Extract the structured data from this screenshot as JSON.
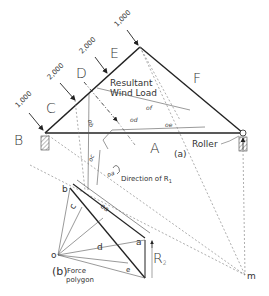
{
  "diagram": {
    "part_a_label": "(a)",
    "part_b_label": "(b)",
    "truss": {
      "regions": [
        "A",
        "B",
        "C",
        "D",
        "E",
        "F"
      ],
      "loads": [
        {
          "value": "1,000",
          "region_before": "B",
          "region_after": "C"
        },
        {
          "value": "2,000",
          "region_before": "C",
          "region_after": "D"
        },
        {
          "value": "2,000",
          "region_before": "D",
          "region_after": "E"
        },
        {
          "value": "1,000",
          "region_before": "E",
          "region_after": "F"
        }
      ],
      "resultant_label_line1": "Resultant",
      "resultant_label_line2": "Wind Load",
      "right_support_label": "Roller",
      "direction_label": "Direction of R",
      "direction_subscript": "1",
      "funicular_rays": [
        "oa",
        "ob",
        "oc",
        "od",
        "oe",
        "of"
      ],
      "pole_point": "m"
    },
    "force_polygon": {
      "title_line1": "Force",
      "title_line2": "polygon",
      "points": [
        "a",
        "b",
        "c",
        "d",
        "e",
        "o"
      ],
      "reaction_label": "R",
      "reaction_subscript": "2"
    }
  }
}
